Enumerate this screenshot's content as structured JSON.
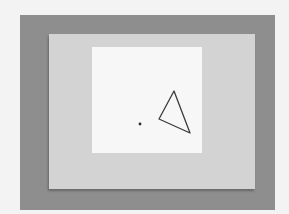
{
  "figure": {
    "colors": {
      "page_background": "#f3f3f3",
      "outer_frame": "#8e8e8e",
      "surround": "#d3d3d3",
      "center_square": "#f7f7f7",
      "stroke": "#3a3a3a"
    },
    "fixation_dot": {
      "cx": 140,
      "cy": 124,
      "r": 1.4
    },
    "triangle": {
      "points": "174,91 159,119 190,133",
      "stroke_width": 1.3
    }
  }
}
